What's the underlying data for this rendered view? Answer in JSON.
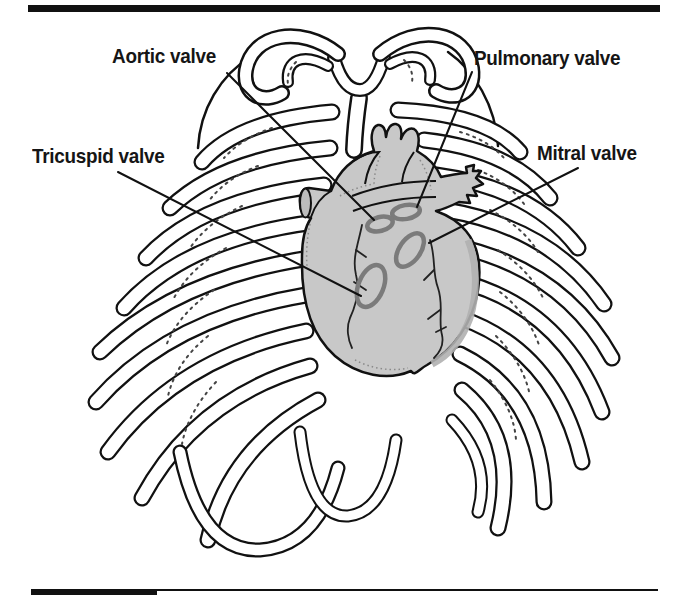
{
  "labels": {
    "aortic": "Aortic valve",
    "pulmonary": "Pulmonary valve",
    "tricuspid": "Tricuspid valve",
    "mitral": "Mitral valve"
  },
  "colors": {
    "background": "#ffffff",
    "ink": "#111111",
    "heart_fill": "#c8c8c8",
    "heart_shadow": "#b0b0b0",
    "valve_ring": "#7b7b7b"
  }
}
